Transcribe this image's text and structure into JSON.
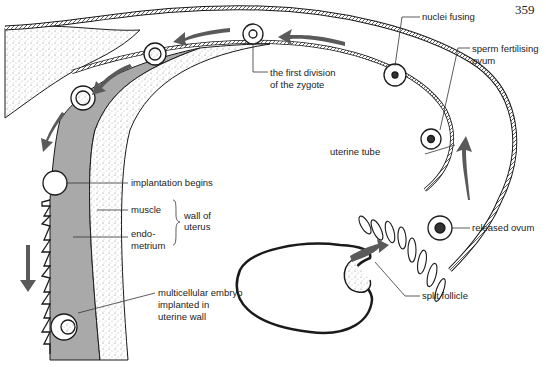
{
  "page_number": "359",
  "labels": {
    "nuclei_fusing": "nuclei fusing",
    "sperm_fertilising": [
      "sperm fertilising",
      "ovum"
    ],
    "first_division": [
      "the first division",
      "of the zygote"
    ],
    "uterine_tube": "uterine tube",
    "implantation_begins": "implantation begins",
    "muscle": "muscle",
    "endometrium": [
      "endo-",
      "metrium"
    ],
    "wall_of_uterus": [
      "wall of",
      "uterus"
    ],
    "released_ovum": "released ovum",
    "multicellular_embryo": [
      "multicellular embryo",
      "implanted in",
      "uterine wall"
    ],
    "split_follicle": "split follicle"
  },
  "colors": {
    "line": "#1a1a1a",
    "endometrium_fill": "#a9a9a9",
    "arrow_fill": "#5a5a5a",
    "stipple": "#777777"
  }
}
